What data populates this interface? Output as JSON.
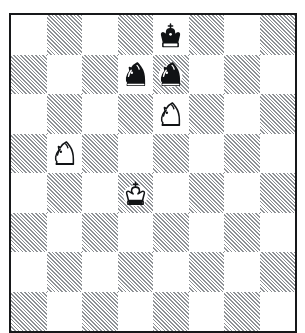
{
  "diagram": {
    "kind": "chess-diagram",
    "orientation": "white-bottom",
    "files": [
      "a",
      "b",
      "c",
      "d",
      "e",
      "f",
      "g",
      "h"
    ],
    "ranks": [
      "8",
      "7",
      "6",
      "5",
      "4",
      "3",
      "2",
      "1"
    ],
    "board_style": {
      "light_square_color": "#ffffff",
      "dark_square_color": "#8e9195",
      "dark_square_fill": "diagonal-hatch-45",
      "border_color": "#17181a",
      "background_color": "#ffffff"
    },
    "squares": [
      [
        "light",
        "dark",
        "light",
        "dark",
        "light",
        "dark",
        "light",
        "dark"
      ],
      [
        "dark",
        "light",
        "dark",
        "light",
        "dark",
        "light",
        "dark",
        "light"
      ],
      [
        "light",
        "dark",
        "light",
        "dark",
        "light",
        "dark",
        "light",
        "dark"
      ],
      [
        "dark",
        "light",
        "dark",
        "light",
        "dark",
        "light",
        "dark",
        "light"
      ],
      [
        "light",
        "dark",
        "light",
        "dark",
        "light",
        "dark",
        "light",
        "dark"
      ],
      [
        "dark",
        "light",
        "dark",
        "light",
        "dark",
        "light",
        "dark",
        "light"
      ],
      [
        "light",
        "dark",
        "light",
        "dark",
        "light",
        "dark",
        "light",
        "dark"
      ],
      [
        "dark",
        "light",
        "dark",
        "light",
        "dark",
        "light",
        "dark",
        "light"
      ]
    ],
    "pieces": [
      {
        "square": "e8",
        "row": 0,
        "col": 4,
        "color": "black",
        "type": "king",
        "glyph": "black-king",
        "name": "black-king-e8"
      },
      {
        "square": "d7",
        "row": 1,
        "col": 3,
        "color": "black",
        "type": "knight",
        "glyph": "black-knight",
        "name": "black-knight-d7"
      },
      {
        "square": "e7",
        "row": 1,
        "col": 4,
        "color": "black",
        "type": "knight",
        "glyph": "black-knight",
        "name": "black-knight-e7"
      },
      {
        "square": "e6",
        "row": 2,
        "col": 4,
        "color": "white",
        "type": "knight",
        "glyph": "white-knight",
        "name": "white-knight-e6"
      },
      {
        "square": "b5",
        "row": 3,
        "col": 1,
        "color": "white",
        "type": "knight",
        "glyph": "white-knight",
        "name": "white-knight-b5"
      },
      {
        "square": "d4",
        "row": 4,
        "col": 3,
        "color": "white",
        "type": "king",
        "glyph": "white-king",
        "name": "white-king-d4"
      }
    ],
    "fen": "4k3/3nn3/4N3/1N6/3K4/8/8/8",
    "material": {
      "white": [
        "king",
        "knight",
        "knight"
      ],
      "black": [
        "king",
        "knight",
        "knight"
      ]
    }
  }
}
